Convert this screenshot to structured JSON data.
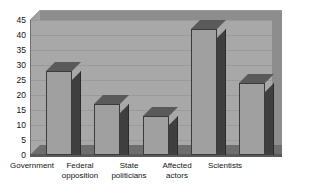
{
  "chart_data": {
    "type": "bar",
    "title": "",
    "subtitle": "",
    "xlabel": "",
    "ylabel": "",
    "categories": [
      "Government",
      "Federal opposition",
      "State politicians",
      "Affected actors",
      "Scientists"
    ],
    "values": [
      28,
      17,
      13,
      42,
      24
    ],
    "ylim": [
      0,
      45
    ],
    "ytick_labels": [
      "45",
      "40",
      "35",
      "30",
      "25",
      "20",
      "15",
      "10",
      "5",
      "0"
    ],
    "ytick_values": [
      45,
      40,
      35,
      30,
      25,
      20,
      15,
      10,
      5,
      0
    ],
    "grid": true,
    "legend": false,
    "style": "3d-column",
    "colors": {
      "bar_face": "#a0a0a0",
      "bar_side": "#3f3f3f",
      "bar_top": "#5a5a5a",
      "plot_background": "#a8a8a8",
      "floor": "#6e6e6e",
      "gridline": "#9a9a9a",
      "text": "#121212",
      "page_background": "#ffffff"
    }
  }
}
